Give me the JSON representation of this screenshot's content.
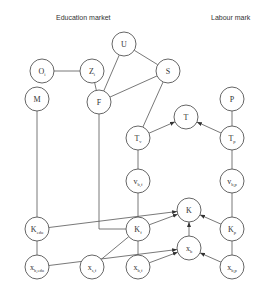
{
  "headings": {
    "education": "Education market",
    "labour": "Labour mark"
  },
  "nodes": [
    {
      "id": "O",
      "label": "O",
      "sub": "i",
      "x": 42,
      "y": 71
    },
    {
      "id": "Z",
      "label": "Z",
      "sub": "i",
      "x": 92,
      "y": 71
    },
    {
      "id": "U",
      "label": "U",
      "sub": "",
      "x": 124,
      "y": 44
    },
    {
      "id": "S",
      "label": "S",
      "sub": "",
      "x": 168,
      "y": 71
    },
    {
      "id": "M",
      "label": "M",
      "sub": "",
      "x": 37,
      "y": 99
    },
    {
      "id": "F",
      "label": "F",
      "sub": "",
      "x": 99,
      "y": 102
    },
    {
      "id": "P",
      "label": "P",
      "sub": "",
      "x": 232,
      "y": 99
    },
    {
      "id": "T",
      "label": "T",
      "sub": "",
      "x": 186,
      "y": 117
    },
    {
      "id": "Tv",
      "label": "T",
      "sub": "v",
      "x": 138,
      "y": 138
    },
    {
      "id": "Tp",
      "label": "T",
      "sub": "p",
      "x": 232,
      "y": 138
    },
    {
      "id": "vbf",
      "label": "v",
      "sub": "b,f",
      "x": 138,
      "y": 181
    },
    {
      "id": "vbp",
      "label": "v",
      "sub": "b,p",
      "x": 232,
      "y": 181
    },
    {
      "id": "K",
      "label": "K",
      "sub": "",
      "x": 189,
      "y": 210
    },
    {
      "id": "Kedu",
      "label": "K",
      "sub": "edu",
      "x": 37,
      "y": 229
    },
    {
      "id": "Kf",
      "label": "K",
      "sub": "f",
      "x": 138,
      "y": 229
    },
    {
      "id": "Kp",
      "label": "K",
      "sub": "p",
      "x": 232,
      "y": 229
    },
    {
      "id": "xb",
      "label": "x",
      "sub": "b",
      "x": 189,
      "y": 248
    },
    {
      "id": "xbedu",
      "label": "x",
      "sub": "b,edu",
      "x": 37,
      "y": 267
    },
    {
      "id": "xsf",
      "label": "x",
      "sub": "s,f",
      "x": 92,
      "y": 267
    },
    {
      "id": "xbf",
      "label": "x",
      "sub": "b,f",
      "x": 138,
      "y": 267
    },
    {
      "id": "xbp",
      "label": "x",
      "sub": "b,p",
      "x": 232,
      "y": 267
    }
  ],
  "edges": [
    {
      "from": "O",
      "to": "Z",
      "arrow": false
    },
    {
      "from": "Z",
      "to": "F",
      "arrow": false
    },
    {
      "from": "U",
      "to": "F",
      "arrow": false
    },
    {
      "from": "U",
      "to": "S",
      "arrow": false
    },
    {
      "from": "S",
      "to": "F",
      "arrow": false
    },
    {
      "from": "S",
      "to": "Tv",
      "arrow": false
    },
    {
      "from": "M",
      "to": "Kedu",
      "arrow": false
    },
    {
      "from": "F",
      "to": "Kf",
      "arrow": false,
      "elbow": true
    },
    {
      "from": "P",
      "to": "Tp",
      "arrow": false
    },
    {
      "from": "Tv",
      "to": "T",
      "arrow": true
    },
    {
      "from": "Tp",
      "to": "T",
      "arrow": true
    },
    {
      "from": "Tv",
      "to": "vbf",
      "arrow": false
    },
    {
      "from": "Tp",
      "to": "vbp",
      "arrow": false
    },
    {
      "from": "vbf",
      "to": "Kf",
      "arrow": false
    },
    {
      "from": "vbp",
      "to": "Kp",
      "arrow": false
    },
    {
      "from": "Kedu",
      "to": "K",
      "arrow": true
    },
    {
      "from": "Kf",
      "to": "K",
      "arrow": true
    },
    {
      "from": "Kp",
      "to": "K",
      "arrow": true
    },
    {
      "from": "xb",
      "to": "K",
      "arrow": true
    },
    {
      "from": "Kedu",
      "to": "xbedu",
      "arrow": false
    },
    {
      "from": "Kf",
      "to": "xbf",
      "arrow": false
    },
    {
      "from": "Kp",
      "to": "xbp",
      "arrow": false
    },
    {
      "from": "xsf",
      "to": "Kf",
      "arrow": false
    },
    {
      "from": "xbedu",
      "to": "xb",
      "arrow": true
    },
    {
      "from": "xbf",
      "to": "xb",
      "arrow": true
    },
    {
      "from": "xbp",
      "to": "xb",
      "arrow": true
    }
  ],
  "style": {
    "stroke": "#555555",
    "text": "#333333",
    "node_radius": 12
  }
}
